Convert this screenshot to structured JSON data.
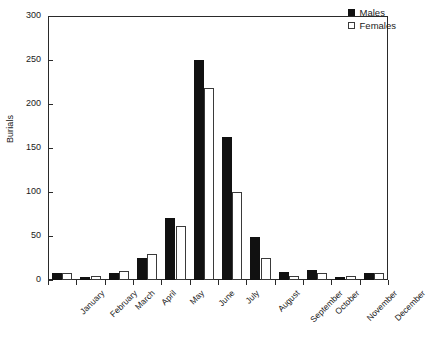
{
  "chart_data": {
    "type": "bar",
    "title": "",
    "xlabel": "",
    "ylabel": "Burials",
    "ylim": [
      0,
      300
    ],
    "yticks": [
      0,
      50,
      100,
      150,
      200,
      250,
      300
    ],
    "grid": false,
    "legend_position": "top-right",
    "categories": [
      "January",
      "February",
      "March",
      "April",
      "May",
      "June",
      "July",
      "August",
      "September",
      "October",
      "November",
      "December"
    ],
    "series": [
      {
        "name": "Males",
        "color": "#111111",
        "values": [
          8,
          3,
          8,
          25,
          70,
          250,
          163,
          49,
          9,
          11,
          3,
          8
        ]
      },
      {
        "name": "Females",
        "color": "#ffffff",
        "values": [
          8,
          4,
          10,
          29,
          61,
          218,
          100,
          25,
          5,
          8,
          5,
          8
        ]
      }
    ]
  },
  "axis": {
    "y_label": "Burials",
    "y_tick_labels": [
      "300",
      "250",
      "200",
      "150",
      "100",
      "50",
      "0"
    ]
  },
  "legend": {
    "items": [
      {
        "label": "Males",
        "marker": "filled-square-icon"
      },
      {
        "label": "Females",
        "marker": "open-square-icon"
      }
    ]
  }
}
